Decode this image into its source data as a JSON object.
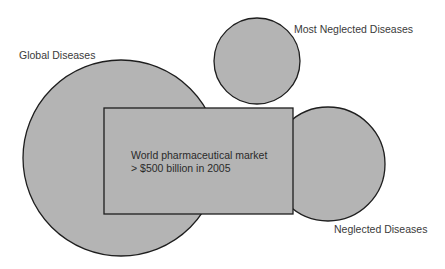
{
  "diagram": {
    "shapes": {
      "global_diseases_circle": {
        "cx": 121,
        "cy": 158,
        "r": 98
      },
      "most_neglected_circle": {
        "cx": 257,
        "cy": 61,
        "r": 43
      },
      "neglected_circle": {
        "cx": 328,
        "cy": 164,
        "r": 57
      },
      "market_rect": {
        "x": 104,
        "y": 108,
        "width": 189,
        "height": 106
      }
    },
    "labels": {
      "global_diseases": "Global Diseases",
      "most_neglected_diseases": "Most Neglected Diseases",
      "neglected_diseases": "Neglected Diseases"
    },
    "market_box": {
      "line1": "World pharmaceutical market",
      "line2": "> $500 billion in 2005"
    },
    "colors": {
      "shape_fill": "#b4b4b4",
      "shape_stroke": "#1e1e1e",
      "text": "#3a3a3a",
      "background": "#ffffff"
    }
  }
}
